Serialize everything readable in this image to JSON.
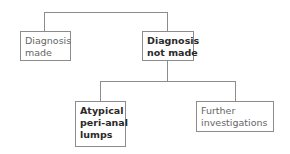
{
  "diagram": {
    "root_branches": [
      {
        "id": "diagnosis-made",
        "lines": [
          "Diagnosis",
          "made"
        ],
        "bold": false
      },
      {
        "id": "diagnosis-not-made",
        "lines": [
          "Diagnosis",
          "not made"
        ],
        "bold": true
      }
    ],
    "children_of_diagnosis_not_made": [
      {
        "id": "atypical-peri-anal-lumps",
        "lines": [
          "Atypical",
          "peri-anal",
          "lumps"
        ],
        "bold": true
      },
      {
        "id": "further-investigations",
        "lines": [
          "Further",
          "investigations"
        ],
        "bold": false
      }
    ],
    "colors": {
      "line": "#8c8c8c",
      "text_normal": "#666666",
      "text_bold": "#2a2a2a"
    }
  }
}
